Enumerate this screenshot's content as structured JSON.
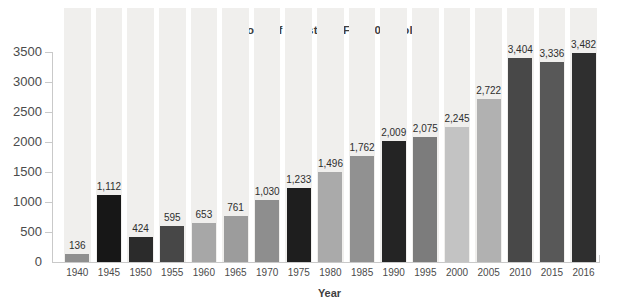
{
  "chart_data": {
    "type": "bar",
    "title": "Billions of constant (FY 2009) dollars",
    "xlabel": "Year",
    "ylabel": "",
    "categories": [
      "1940",
      "1945",
      "1950",
      "1955",
      "1960",
      "1965",
      "1970",
      "1975",
      "1980",
      "1985",
      "1990",
      "1995",
      "2000",
      "2005",
      "2010",
      "2015",
      "2016"
    ],
    "values": [
      136,
      1112,
      424,
      595,
      653,
      761,
      1030,
      1233,
      1496,
      1762,
      2009,
      2075,
      2245,
      2722,
      3404,
      3336,
      3482
    ],
    "value_labels": [
      "136",
      "1,112",
      "424",
      "595",
      "653",
      "761",
      "1,030",
      "1,233",
      "1,496",
      "1,762",
      "2,009",
      "2,075",
      "2,245",
      "2,722",
      "3,404",
      "3,336",
      "3,482"
    ],
    "ylim": [
      0,
      3500
    ],
    "yticks": [
      0,
      500,
      1000,
      1500,
      2000,
      2500,
      3000,
      3500
    ],
    "grid": false,
    "legend": "none",
    "bar_colors": [
      "#8f8f8f",
      "#171717",
      "#2b2b2b",
      "#474747",
      "#a7a7a7",
      "#9c9c9c",
      "#8e8e8e",
      "#1e1e1e",
      "#aaaaaa",
      "#919191",
      "#242424",
      "#7c7c7c",
      "#c3c3c3",
      "#b1b1b1",
      "#484848",
      "#585858",
      "#2f2f2f"
    ],
    "background_column_color": "#f0efed",
    "axis_color": "#c9c9c9",
    "tick_label_color": "#4b4b4b",
    "value_label_color": "#2e2e2e",
    "title_color": "#3f3f3f"
  }
}
